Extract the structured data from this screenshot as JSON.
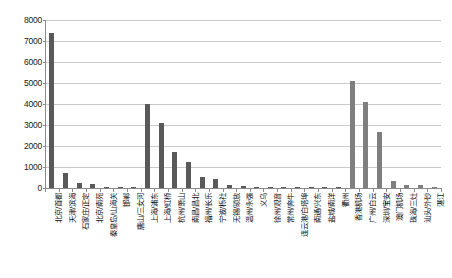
{
  "chart_data": {
    "type": "bar",
    "title": "",
    "subtitle": "",
    "xlabel": "",
    "ylabel": "",
    "ylim": [
      0,
      8000
    ],
    "ytick_values": [
      0,
      1000,
      2000,
      3000,
      4000,
      5000,
      6000,
      7000,
      8000
    ],
    "ytick_labels": [
      "0",
      "1000",
      "2000",
      "3000",
      "4000",
      "5000",
      "6000",
      "7000",
      "8000"
    ],
    "grid": true,
    "legend": "none",
    "bar_color": "#595959",
    "bar_color_alt": "#7f7f7f",
    "categories": [
      "北京/首都",
      "天津/滨海",
      "石家庄/正定",
      "北京/南苑",
      "秦皇岛/山海关",
      "邯郸",
      "唐山/三女河",
      "上海/浦东",
      "上海/虹桥",
      "杭州/萧山",
      "南昌/昌北",
      "福州/长乐",
      "宁波/栎社",
      "无锡/硕放",
      "温州/永强",
      "义乌",
      "徐州/观音",
      "常州/奔牛",
      "连云港/白塔埠",
      "南通/兴东",
      "盐城/南洋",
      "衢州",
      "香港机场",
      "广州/白云",
      "深圳/宝安",
      "澳门机场",
      "珠海/三灶",
      "汕头/外砂",
      "湛江"
    ],
    "values": [
      7380,
      700,
      220,
      185,
      40,
      20,
      25,
      4020,
      3110,
      1700,
      1230,
      530,
      430,
      120,
      95,
      35,
      55,
      30,
      20,
      25,
      15,
      10,
      5080,
      4100,
      2680,
      330,
      150,
      120,
      45
    ]
  }
}
